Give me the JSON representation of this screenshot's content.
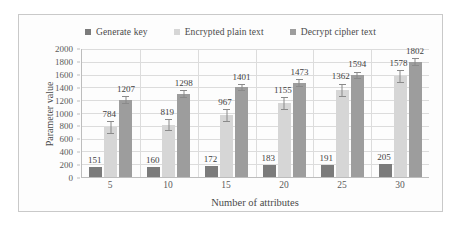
{
  "chart_data": {
    "type": "bar",
    "title": "",
    "xlabel": "Number of attributes",
    "ylabel": "Parameter value",
    "categories": [
      "5",
      "10",
      "15",
      "20",
      "25",
      "30"
    ],
    "ylim": [
      0,
      2000
    ],
    "yticks": [
      0,
      200,
      400,
      600,
      800,
      1000,
      1200,
      1400,
      1600,
      1800,
      2000
    ],
    "ytick_labels": [
      "0",
      "200",
      "400",
      "600",
      "800",
      "1000",
      "1200",
      "1400",
      "1600",
      "1800",
      "2000"
    ],
    "grid": true,
    "legend_position": "top",
    "series": [
      {
        "name": "Generate key",
        "color": "#7b7b7b",
        "values": [
          151,
          160,
          172,
          183,
          191,
          205
        ],
        "labels": [
          "151",
          "160",
          "172",
          "183",
          "191",
          "205"
        ],
        "error": [
          0,
          0,
          0,
          0,
          0,
          0
        ]
      },
      {
        "name": "Encrypted plain text",
        "color": "#d6d6d6",
        "values": [
          784,
          819,
          967,
          1155,
          1362,
          1578
        ],
        "labels": [
          "784",
          "819",
          "967",
          "1155",
          "1362",
          "1578"
        ],
        "error": [
          95,
          95,
          100,
          95,
          100,
          100
        ]
      },
      {
        "name": "Decrypt cipher text",
        "color": "#9d9d9d",
        "values": [
          1207,
          1298,
          1401,
          1473,
          1594,
          1802
        ],
        "labels": [
          "1207",
          "1298",
          "1401",
          "1473",
          "1594",
          "1802"
        ],
        "error": [
          60,
          60,
          60,
          60,
          55,
          60
        ]
      }
    ]
  }
}
